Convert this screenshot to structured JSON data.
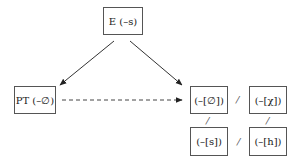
{
  "nodes": {
    "e": {
      "label": "E (–s)"
    },
    "pt": {
      "label": "PT (–∅)"
    },
    "zero": {
      "label": "(–[∅])"
    },
    "chi": {
      "label": "(–[χ])"
    },
    "s": {
      "label": "(–[s])"
    },
    "h": {
      "label": "(–[h])"
    }
  },
  "separators": {
    "top_row": "/",
    "left_col": "/",
    "right_col": "/",
    "bottom_row": "/"
  },
  "edges": [
    {
      "from": "E (–s)",
      "to": "PT (–∅)",
      "style": "solid"
    },
    {
      "from": "E (–s)",
      "to": "(–[∅])",
      "style": "solid"
    },
    {
      "from": "PT (–∅)",
      "to": "(–[∅])",
      "style": "dashed"
    }
  ]
}
